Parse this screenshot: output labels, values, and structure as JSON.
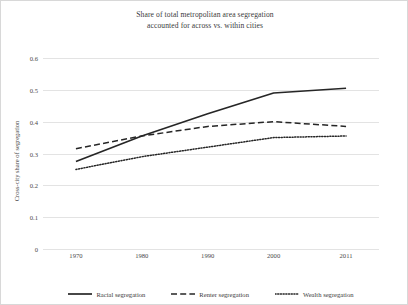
{
  "chart_data": {
    "type": "line",
    "title": "Share of total metropolitan area segregation accounted for across vs. within cities",
    "title_lines": [
      "Share of total metropolitan area segregation",
      "accounted for across vs. within cities"
    ],
    "xlabel": "",
    "ylabel": "Cross-city share of segregation",
    "x": [
      1970,
      1980,
      1990,
      2000,
      2011
    ],
    "xtick_labels": [
      "1970",
      "1980",
      "1990",
      "2000",
      "2011"
    ],
    "ytick_labels": [
      "0",
      "0.1",
      "0.2",
      "0.3",
      "0.4",
      "0.5",
      "0.6"
    ],
    "ytick_values": [
      0,
      0.1,
      0.2,
      0.3,
      0.4,
      0.5,
      0.6
    ],
    "ylim": [
      0,
      0.6
    ],
    "xlim": [
      1965,
      2016
    ],
    "grid": "horizontal",
    "legend_position": "bottom",
    "series": [
      {
        "name": "Racial segregation",
        "style": "solid",
        "color": "#262626",
        "values": [
          0.275,
          0.355,
          0.425,
          0.49,
          0.505
        ]
      },
      {
        "name": "Renter segregation",
        "style": "dashed",
        "color": "#262626",
        "values": [
          0.315,
          0.355,
          0.385,
          0.4,
          0.385
        ]
      },
      {
        "name": "Wealth segregation",
        "style": "dotted",
        "color": "#262626",
        "values": [
          0.25,
          0.29,
          0.32,
          0.35,
          0.355
        ]
      }
    ]
  },
  "colors": {
    "background": "#ffffff",
    "gridline": "#e3e3e3",
    "text": "#3a3a3a",
    "line": "#262626",
    "border": "#d8d8d8"
  }
}
